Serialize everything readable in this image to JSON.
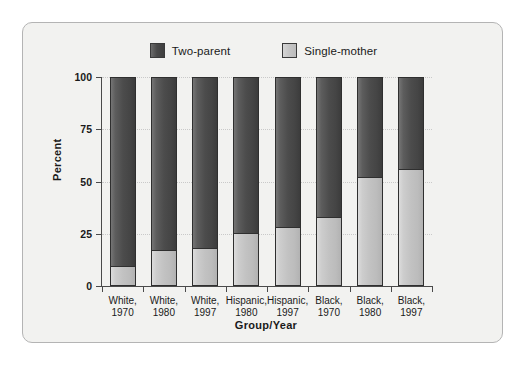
{
  "chart_data": {
    "type": "bar",
    "stacked": true,
    "title": "",
    "xlabel": "Group/Year",
    "ylabel": "Percent",
    "ylim": [
      0,
      100
    ],
    "yticks": [
      0,
      25,
      50,
      75,
      100
    ],
    "ytick_labels": [
      "0",
      "25",
      "50",
      "75",
      "100"
    ],
    "grid": true,
    "grid_axis": "y",
    "legend_position": "top-center",
    "categories": [
      "White,\n1970",
      "White,\n1980",
      "White,\n1997",
      "Hispanic,\n1980",
      "Hispanic,\n1997",
      "Black,\n1970",
      "Black,\n1980",
      "Black,\n1997"
    ],
    "category_lines": [
      [
        "White,",
        "1970"
      ],
      [
        "White,",
        "1980"
      ],
      [
        "White,",
        "1997"
      ],
      [
        "Hispanic,",
        "1980"
      ],
      [
        "Hispanic,",
        "1997"
      ],
      [
        "Black,",
        "1970"
      ],
      [
        "Black,",
        "1980"
      ],
      [
        "Black,",
        "1997"
      ]
    ],
    "series": [
      {
        "name": "Single-mother",
        "color": "#c6c6c6",
        "values": [
          9,
          17,
          18,
          25,
          28,
          33,
          52,
          56
        ]
      },
      {
        "name": "Two-parent",
        "color": "#4a4a4a",
        "values": [
          91,
          83,
          82,
          75,
          72,
          67,
          48,
          44
        ]
      }
    ]
  },
  "legend": {
    "entries": [
      {
        "label": "Two-parent",
        "swatch": "dark-gray-swatch"
      },
      {
        "label": "Single-mother",
        "swatch": "light-gray-swatch"
      }
    ]
  },
  "axes": {
    "y": {
      "title": "Percent",
      "ticks": [
        "100",
        "75",
        "50",
        "25",
        "0"
      ]
    },
    "x": {
      "title": "Group/Year"
    }
  },
  "colors": {
    "two_parent": "#4a4a4a",
    "single_mother": "#c6c6c6",
    "panel_background": "#f2f2f0",
    "panel_border": "#b4b4b4",
    "axis": "#4a4a4a",
    "gridline": "#c9c9c9",
    "text": "#1a1a1a"
  }
}
